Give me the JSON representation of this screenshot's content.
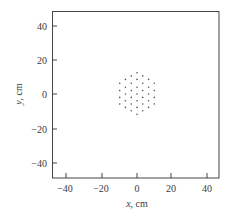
{
  "chart_data": {
    "type": "scatter",
    "title": "",
    "xlabel": "x, cm",
    "ylabel": "y, cm",
    "xlim": [
      -49,
      48
    ],
    "ylim": [
      -49,
      48
    ],
    "xticks": [
      -40,
      -20,
      0,
      20,
      40
    ],
    "yticks": [
      -40,
      -20,
      0,
      20,
      40
    ],
    "grid": false,
    "legend": null,
    "series": [
      {
        "name": "points",
        "marker": "dot",
        "color": "#555555",
        "points": [
          [
            -10,
            6.2
          ],
          [
            -10,
            2.0
          ],
          [
            -10,
            -2.0
          ],
          [
            -10,
            -5.8
          ],
          [
            -6.7,
            8.5
          ],
          [
            -6.7,
            3.9
          ],
          [
            -6.7,
            0
          ],
          [
            -6.7,
            -3.9
          ],
          [
            -6.7,
            -7.8
          ],
          [
            -3.3,
            10.5
          ],
          [
            -3.3,
            6.2
          ],
          [
            -3.3,
            2.0
          ],
          [
            -3.3,
            -2.0
          ],
          [
            -3.3,
            -5.8
          ],
          [
            -3.3,
            -9.7
          ],
          [
            0,
            12.4
          ],
          [
            0,
            8.5
          ],
          [
            0,
            3.9
          ],
          [
            0,
            0
          ],
          [
            0,
            -3.9
          ],
          [
            0,
            -7.8
          ],
          [
            0,
            -11.8
          ],
          [
            3.3,
            10.5
          ],
          [
            3.3,
            6.2
          ],
          [
            3.3,
            2.0
          ],
          [
            3.3,
            -2.0
          ],
          [
            3.3,
            -5.8
          ],
          [
            3.3,
            -9.7
          ],
          [
            6.7,
            8.5
          ],
          [
            6.7,
            3.9
          ],
          [
            6.7,
            0
          ],
          [
            6.7,
            -3.9
          ],
          [
            6.7,
            -7.8
          ],
          [
            10,
            6.2
          ],
          [
            10,
            2.0
          ],
          [
            10,
            -2.0
          ],
          [
            10,
            -5.8
          ]
        ]
      }
    ]
  },
  "axes": {
    "x_label_var": "x",
    "x_label_unit": ", cm",
    "y_label_var": "y",
    "y_label_unit": ", cm",
    "x_tick_labels": [
      "−40",
      "−20",
      "0",
      "20",
      "40"
    ],
    "y_tick_labels": [
      "40",
      "20",
      "0",
      "−20",
      "−40"
    ]
  }
}
